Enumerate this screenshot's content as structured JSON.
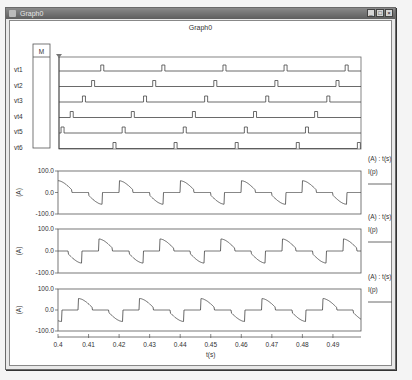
{
  "window": {
    "title": "Graph0",
    "controls": [
      "minimize",
      "maximize",
      "close"
    ]
  },
  "graph": {
    "title": "Graph0",
    "marker_box_label": "M",
    "digital_traces": [
      "vt1",
      "vt2",
      "vt3",
      "vt4",
      "vt5",
      "vt6"
    ],
    "analog_plots": [
      {
        "y_unit": "(A)",
        "legend_header": "(A) : t(s)",
        "legend_item": "I(p)",
        "yticks": [
          "100.0",
          "0.0",
          "-100.0"
        ]
      },
      {
        "y_unit": "(A)",
        "legend_header": "(A) : t(s)",
        "legend_item": "I(p)",
        "yticks": [
          "100.0",
          "0.0",
          "-100.0"
        ]
      },
      {
        "y_unit": "(A)",
        "legend_header": "(A) : t(s)",
        "legend_item": "I(p)",
        "yticks": [
          "100.0",
          "0.0",
          "-100.0"
        ]
      }
    ],
    "xticks": [
      "0.4",
      "0.41",
      "0.42",
      "0.43",
      "0.44",
      "0.45",
      "0.46",
      "0.47",
      "0.48",
      "0.49"
    ],
    "xlabel": "t(s)"
  },
  "chart_data": [
    {
      "type": "line",
      "title": "Graph0 - gate pulses",
      "series_names": [
        "vt1",
        "vt2",
        "vt3",
        "vt4",
        "vt5",
        "vt6"
      ],
      "xlim": [
        0.4,
        0.5
      ],
      "period": 0.02,
      "pulse_times_approx": {
        "vt1": [
          0.414,
          0.434,
          0.454,
          0.474,
          0.494
        ],
        "vt2": [
          0.411,
          0.431,
          0.451,
          0.471,
          0.491
        ],
        "vt3": [
          0.408,
          0.428,
          0.448,
          0.468,
          0.488
        ],
        "vt4": [
          0.404,
          0.424,
          0.444,
          0.464,
          0.484
        ],
        "vt5": [
          0.401,
          0.421,
          0.441,
          0.461,
          0.481
        ],
        "vt6": [
          0.418,
          0.438,
          0.458,
          0.478,
          0.498
        ]
      }
    },
    {
      "type": "line",
      "title": "Phase current 1",
      "xlabel": "t(s)",
      "ylabel": "(A)",
      "ylim": [
        -100,
        100
      ],
      "legend": [
        "I(p)"
      ],
      "description": "Alternating positive/negative curved pulses of ~55 A peak, period 0.02 s, zero segments between",
      "phase_offset": 0.0
    },
    {
      "type": "line",
      "title": "Phase current 2",
      "xlabel": "t(s)",
      "ylabel": "(A)",
      "ylim": [
        -100,
        100
      ],
      "legend": [
        "I(p)"
      ],
      "description": "Same waveform shifted by 1/3 period",
      "phase_offset": 0.00667
    },
    {
      "type": "line",
      "title": "Phase current 3",
      "xlabel": "t(s)",
      "ylabel": "(A)",
      "ylim": [
        -100,
        100
      ],
      "legend": [
        "I(p)"
      ],
      "description": "Same waveform shifted by 2/3 period",
      "phase_offset": 0.01333
    }
  ]
}
